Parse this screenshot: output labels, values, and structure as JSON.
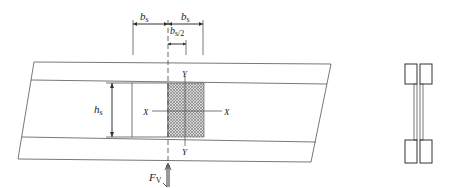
{
  "diagram": {
    "type": "engineering-drawing",
    "dimensions": {
      "left_bs": {
        "symbol": "b",
        "subscript": "s"
      },
      "right_bs": {
        "symbol": "b",
        "subscript": "s"
      },
      "half_bs": {
        "symbol": "b",
        "subscript": "s/2"
      },
      "height": {
        "symbol": "h",
        "subscript": "s"
      }
    },
    "axes": {
      "x_left": "X",
      "x_right": "X",
      "y_top": "Y",
      "y_bottom": "Y"
    },
    "force": {
      "symbol": "F",
      "subscript": "V"
    },
    "section_view": {
      "label": "",
      "parts": [
        "top-flange-left",
        "top-flange-right",
        "web-left",
        "web-right",
        "bottom-flange-left",
        "bottom-flange-right"
      ]
    },
    "colors": {
      "line": "#555555",
      "hatch": "#8a8a8a",
      "background": "#ffffff"
    }
  }
}
